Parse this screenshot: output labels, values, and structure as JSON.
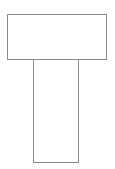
{
  "diagram": {
    "shapes": [
      {
        "id": "top-bar",
        "type": "rectangle",
        "x": 7,
        "y": 14,
        "width": 100,
        "height": 46,
        "stroke": "#8a8a8a",
        "fill": "#ffffff"
      },
      {
        "id": "stem",
        "type": "rectangle",
        "x": 33,
        "y": 59,
        "width": 46,
        "height": 104,
        "stroke": "#8a8a8a",
        "fill": "#ffffff"
      }
    ]
  }
}
